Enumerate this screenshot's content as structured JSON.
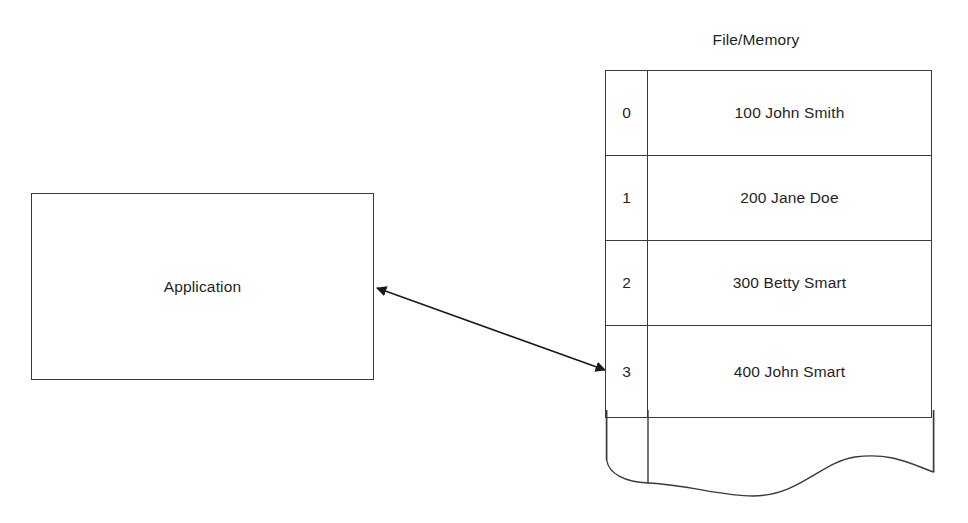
{
  "diagram": {
    "application": {
      "label": "Application"
    },
    "memory": {
      "title": "File/Memory",
      "columns": [
        "index",
        "record"
      ],
      "rows": [
        {
          "index": "0",
          "value": "100 John Smith"
        },
        {
          "index": "1",
          "value": "200 Jane Doe"
        },
        {
          "index": "2",
          "value": "300 Betty Smart"
        },
        {
          "index": "3",
          "value": "400 John Smart"
        }
      ],
      "continuation": "torn-edge"
    },
    "connector": {
      "type": "double-headed-arrow",
      "from": "Application",
      "to": "File/Memory"
    },
    "colors": {
      "stroke": "#3a3a3a",
      "text": "#1f1f1f",
      "background": "#ffffff"
    }
  }
}
